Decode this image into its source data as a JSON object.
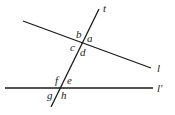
{
  "diagram": {
    "lines": {
      "transversal": {
        "label": "t",
        "x1": 99,
        "y1": 9,
        "x2": 51,
        "y2": 107
      },
      "line_l": {
        "label": "l",
        "x1": 23,
        "y1": 21,
        "x2": 151,
        "y2": 68
      },
      "line_l_prime": {
        "label": "l′",
        "x1": 5,
        "y1": 88,
        "x2": 153,
        "y2": 88
      }
    },
    "angles": {
      "a": "a",
      "b": "b",
      "c": "c",
      "d": "d",
      "e": "e",
      "f": "f",
      "g": "g",
      "h": "h"
    },
    "labels": {
      "t": "t",
      "l": "l",
      "l_prime": "l′"
    },
    "color": "#1a1a1a"
  }
}
